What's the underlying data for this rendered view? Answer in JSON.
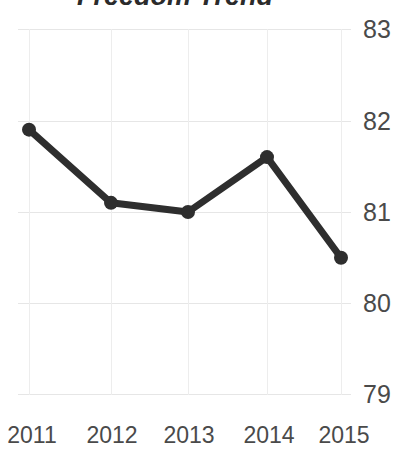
{
  "chart_data": {
    "type": "line",
    "title": "Freedom Trend",
    "xlabel": "",
    "ylabel": "",
    "categories": [
      "2011",
      "2012",
      "2013",
      "2014",
      "2015"
    ],
    "values": [
      81.9,
      81.1,
      81.0,
      81.6,
      80.5
    ],
    "series": [
      {
        "name": "Freedom Score",
        "values": [
          81.9,
          81.1,
          81.0,
          81.6,
          80.5
        ]
      }
    ],
    "ylim": [
      79,
      83
    ],
    "yticks": [
      "79",
      "80",
      "81",
      "82",
      "83"
    ],
    "ytick_values": [
      79,
      80,
      81,
      82,
      83
    ],
    "xticks": [
      "2011",
      "2012",
      "2013",
      "2014",
      "2015"
    ],
    "grid": true,
    "legend": false,
    "legend_position": "none",
    "y_axis_position": "right",
    "markers": true,
    "colors": {
      "line": "#2e2e2e",
      "marker": "#2e2e2e",
      "grid": "#e6e6e6",
      "text": "#4a4a4a",
      "title": "#2b2b2b",
      "background": "#ffffff"
    }
  }
}
